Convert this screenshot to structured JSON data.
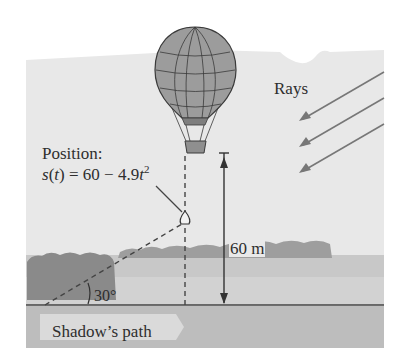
{
  "figure": {
    "position_title": "Position:",
    "position_equation": {
      "lhs_func": "s",
      "lhs_var": "t",
      "equals": " = 60 − 4.9",
      "var": "t",
      "exponent": "2"
    },
    "rays_label": "Rays",
    "height_label": "60 m",
    "angle_label": "30°",
    "shadow_path_label": "Shadow’s path",
    "colors": {
      "sky_panel": "#e8e8e8",
      "ground": "#b9b9b9",
      "field": "#cdcdcd",
      "trees": "#8c8c8c",
      "balloon": "#9a9a9a",
      "lines": "#333333",
      "shadow_band": "#bdbdbd",
      "shadow_arrow": "#dedede"
    }
  }
}
